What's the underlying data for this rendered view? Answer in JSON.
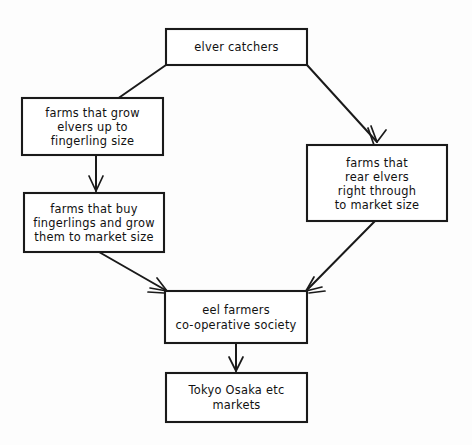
{
  "diagram": {
    "style": {
      "background": "#fdfdfd",
      "line_color": "#1a1a1a",
      "box_fill": "#ffffff",
      "text_color": "#111111"
    },
    "nodes": [
      {
        "id": "elver-catchers",
        "lines": [
          "elver catchers"
        ],
        "x": 166,
        "y": 29,
        "w": 141,
        "h": 36
      },
      {
        "id": "farms-grow-elvers",
        "lines": [
          "farms that grow",
          "elvers up to",
          "fingerling size"
        ],
        "x": 22,
        "y": 98,
        "w": 141,
        "h": 57
      },
      {
        "id": "farms-buy-fingerlings",
        "lines": [
          "farms that buy",
          "fingerlings and grow",
          "them to market size"
        ],
        "x": 24,
        "y": 193,
        "w": 140,
        "h": 59
      },
      {
        "id": "farms-rear-elvers",
        "lines": [
          "farms that",
          "rear elvers",
          "right through",
          "to market size"
        ],
        "x": 307,
        "y": 145,
        "w": 140,
        "h": 76
      },
      {
        "id": "eel-farmers-cooperative",
        "lines": [
          "eel farmers",
          "co-operative society"
        ],
        "x": 165,
        "y": 291,
        "w": 142,
        "h": 52
      },
      {
        "id": "markets",
        "lines": [
          "Tokyo Osaka etc",
          "markets"
        ],
        "x": 166,
        "y": 373,
        "w": 141,
        "h": 49
      }
    ],
    "edges": [
      {
        "id": "catchers-to-grow",
        "from": "elver-catchers",
        "to": "farms-grow-elvers",
        "label": ""
      },
      {
        "id": "catchers-to-rear",
        "from": "elver-catchers",
        "to": "farms-rear-elvers",
        "label": ""
      },
      {
        "id": "grow-to-buy",
        "from": "farms-grow-elvers",
        "to": "farms-buy-fingerlings",
        "label": ""
      },
      {
        "id": "buy-to-cooperative",
        "from": "farms-buy-fingerlings",
        "to": "eel-farmers-cooperative",
        "label": ""
      },
      {
        "id": "rear-to-cooperative",
        "from": "farms-rear-elvers",
        "to": "eel-farmers-cooperative",
        "label": ""
      },
      {
        "id": "cooperative-to-markets",
        "from": "eel-farmers-cooperative",
        "to": "markets",
        "label": ""
      }
    ]
  }
}
